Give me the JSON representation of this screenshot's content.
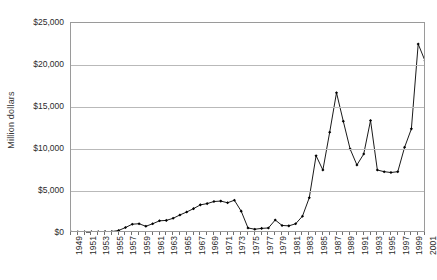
{
  "chart_data": {
    "type": "line",
    "title": "",
    "xlabel": "",
    "ylabel": "Million dollars",
    "ylim": [
      0,
      25000
    ],
    "ytick_labels": [
      "$0",
      "$5,000",
      "$10,000",
      "$15,000",
      "$20,000",
      "$25,000"
    ],
    "ytick_values": [
      0,
      5000,
      10000,
      15000,
      20000,
      25000
    ],
    "grid": true,
    "legend": "none",
    "markers": true,
    "marker_shape": "diamond",
    "line_color": "#000000",
    "marker_color": "#000000",
    "xtick_labels": [
      "1949",
      "1951",
      "1953",
      "1955",
      "1957",
      "1959",
      "1961",
      "1963",
      "1965",
      "1967",
      "1969",
      "1971",
      "1973",
      "1975",
      "1977",
      "1979",
      "1981",
      "1983",
      "1985",
      "1987",
      "1989",
      "1991",
      "1993",
      "1995",
      "1997",
      "1999",
      "2001"
    ],
    "x": [
      1949,
      1950,
      1951,
      1952,
      1953,
      1954,
      1955,
      1956,
      1957,
      1958,
      1959,
      1960,
      1961,
      1962,
      1963,
      1964,
      1965,
      1966,
      1967,
      1968,
      1969,
      1970,
      1971,
      1972,
      1973,
      1974,
      1975,
      1976,
      1977,
      1978,
      1979,
      1980,
      1981,
      1982,
      1983,
      1984,
      1985,
      1986,
      1987,
      1988,
      1989,
      1990,
      1991,
      1992,
      1993,
      1994,
      1995,
      1996,
      1997,
      1998,
      1999,
      2000,
      2001
    ],
    "values": [
      120,
      130,
      140,
      150,
      150,
      160,
      170,
      300,
      650,
      1050,
      1100,
      800,
      1100,
      1450,
      1500,
      1750,
      2150,
      2500,
      2900,
      3350,
      3500,
      3750,
      3800,
      3600,
      3900,
      2600,
      600,
      450,
      550,
      600,
      1550,
      900,
      850,
      1100,
      2000,
      4200,
      9200,
      7500,
      12000,
      16700,
      13300,
      10000,
      8100,
      9400,
      13400,
      7500,
      7300,
      7200,
      7300,
      10200,
      12400,
      22500,
      20500
    ]
  },
  "axis_labels": {
    "y_title": "Million dollars"
  }
}
